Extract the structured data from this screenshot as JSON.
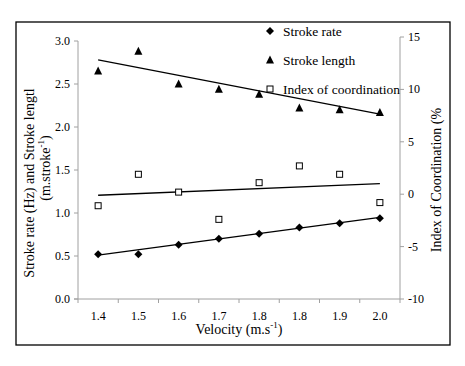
{
  "chart_data": {
    "type": "scatter",
    "title": "",
    "xlabel": "Velocity (m.s-1)",
    "xlabel_main": "Velocity (m.s",
    "xlabel_sup": "-1",
    "xlabel_close": ")",
    "ylabel_left_line1": "Stroke rate (Hz) and Stroke lengtl",
    "ylabel_left_line2_main": "(m.stroke",
    "ylabel_left_line2_sup": "-1",
    "ylabel_left_line2_close": ")",
    "ylabel_right": "Index of Coordination (%",
    "categories": [
      "1.4",
      "1.5",
      "1.6",
      "1.7",
      "1.8",
      "1.8",
      "1.9",
      "2.0"
    ],
    "ylim_left": [
      0.0,
      3.0
    ],
    "yticks_left": [
      "0.0",
      "0.5",
      "1.0",
      "1.5",
      "2.0",
      "2.5",
      "3.0"
    ],
    "ylim_right": [
      -10,
      15
    ],
    "yticks_right": [
      "-10",
      "-5",
      "0",
      "5",
      "10",
      "15"
    ],
    "grid": false,
    "legend_position": "upper right (inside plot)",
    "series": [
      {
        "name": "Stroke rate",
        "axis": "left",
        "marker": "diamond",
        "values": [
          0.52,
          0.52,
          0.63,
          0.7,
          0.76,
          0.83,
          0.88,
          0.94
        ],
        "trendline": {
          "type": "linear",
          "start": 0.51,
          "end": 0.95
        }
      },
      {
        "name": "Stroke length",
        "axis": "left",
        "marker": "triangle",
        "values": [
          2.65,
          2.88,
          2.5,
          2.44,
          2.38,
          2.22,
          2.2,
          2.17
        ],
        "trendline": {
          "type": "linear",
          "start": 2.78,
          "end": 2.15
        }
      },
      {
        "name": "Index of coordination",
        "axis": "right",
        "marker": "square-open",
        "values": [
          -1.1,
          1.9,
          0.2,
          -2.4,
          1.1,
          2.7,
          1.9,
          -0.8
        ],
        "trendline": {
          "type": "linear",
          "start": -0.1,
          "end": 1.0
        }
      }
    ]
  },
  "legend": {
    "items": [
      {
        "label": "Stroke rate",
        "marker": "diamond"
      },
      {
        "label": "Stroke length",
        "marker": "triangle"
      },
      {
        "label": "Index of coordination",
        "marker": "square-open"
      }
    ]
  },
  "colors": {
    "frame": "#000000",
    "axis": "#a0a0a0",
    "series": "#000000",
    "background": "#ffffff"
  }
}
